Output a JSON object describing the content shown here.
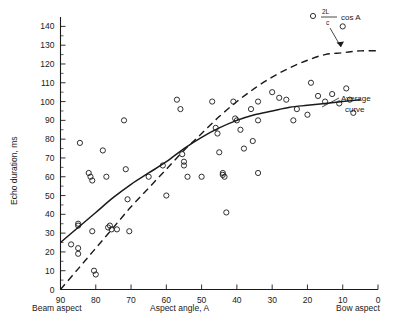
{
  "chart_data": {
    "type": "scatter",
    "title": "",
    "xlabel": "Aspect angle, A",
    "ylabel": "Echo duration, ms",
    "xlim": [
      90,
      0
    ],
    "ylim": [
      0,
      145
    ],
    "x_reversed": true,
    "grid": false,
    "legend_position": "none",
    "xticks": [
      90,
      80,
      70,
      60,
      50,
      40,
      30,
      20,
      10,
      0
    ],
    "xticklabels": [
      "90",
      "80",
      "70",
      "60",
      "50",
      "40",
      "30",
      "20",
      "10",
      "0"
    ],
    "yticks": [
      0,
      10,
      20,
      30,
      40,
      50,
      60,
      70,
      80,
      90,
      100,
      110,
      120,
      130,
      140
    ],
    "yticklabels": [
      "0",
      "10",
      "20",
      "30",
      "40",
      "50",
      "60",
      "70",
      "80",
      "90",
      "100",
      "110",
      "120",
      "130",
      "140"
    ],
    "x_end_labels": {
      "left": "Beam aspect",
      "right": "Bow aspect"
    },
    "points": [
      [
        87,
        24
      ],
      [
        85,
        35
      ],
      [
        85,
        34
      ],
      [
        85,
        22
      ],
      [
        85,
        19
      ],
      [
        84.5,
        78
      ],
      [
        82,
        62
      ],
      [
        81.5,
        60
      ],
      [
        81,
        58
      ],
      [
        81,
        31
      ],
      [
        80.5,
        10
      ],
      [
        80,
        8
      ],
      [
        78,
        74
      ],
      [
        77,
        60
      ],
      [
        76.5,
        33
      ],
      [
        76,
        34
      ],
      [
        75.5,
        32
      ],
      [
        74,
        32
      ],
      [
        72,
        90
      ],
      [
        71.5,
        64
      ],
      [
        71,
        48
      ],
      [
        70.5,
        31
      ],
      [
        65,
        60
      ],
      [
        61,
        66
      ],
      [
        60,
        50
      ],
      [
        57,
        101
      ],
      [
        56,
        96
      ],
      [
        55.5,
        72
      ],
      [
        55,
        68
      ],
      [
        55,
        66
      ],
      [
        54,
        60
      ],
      [
        50,
        60
      ],
      [
        47,
        100
      ],
      [
        46,
        86
      ],
      [
        45.5,
        83
      ],
      [
        45,
        73
      ],
      [
        44,
        62
      ],
      [
        44,
        61
      ],
      [
        43.5,
        60
      ],
      [
        43,
        41
      ],
      [
        41,
        100
      ],
      [
        40.5,
        91
      ],
      [
        40,
        90
      ],
      [
        39,
        85
      ],
      [
        38,
        75
      ],
      [
        36,
        96
      ],
      [
        35.5,
        79
      ],
      [
        34,
        100
      ],
      [
        34,
        90
      ],
      [
        34,
        62
      ],
      [
        30,
        105
      ],
      [
        28,
        102
      ],
      [
        26,
        101
      ],
      [
        24,
        90
      ],
      [
        23,
        96
      ],
      [
        20,
        93
      ],
      [
        19,
        110
      ],
      [
        17,
        103
      ],
      [
        15,
        100
      ],
      [
        13,
        104
      ],
      [
        11,
        99
      ],
      [
        10,
        140
      ],
      [
        9,
        107
      ],
      [
        8,
        101
      ],
      [
        7,
        94
      ]
    ],
    "series": [
      {
        "name": "Average curve",
        "style": "solid",
        "annotation": "Average curve",
        "points": [
          [
            90,
            25
          ],
          [
            85,
            33
          ],
          [
            80,
            41
          ],
          [
            75,
            49
          ],
          [
            70,
            56
          ],
          [
            65,
            62
          ],
          [
            60,
            68
          ],
          [
            55,
            75
          ],
          [
            50,
            81
          ],
          [
            45,
            86
          ],
          [
            40,
            90
          ],
          [
            35,
            93
          ],
          [
            30,
            95
          ],
          [
            25,
            97
          ],
          [
            20,
            98
          ],
          [
            15,
            99
          ],
          [
            10,
            100
          ],
          [
            5,
            101
          ]
        ]
      },
      {
        "name": "2L/c cos A",
        "style": "dashed",
        "annotation_numerator": "2L",
        "annotation_denominator": "c",
        "annotation_suffix": "cos A",
        "points": [
          [
            90,
            0
          ],
          [
            85,
            11
          ],
          [
            80,
            22
          ],
          [
            75,
            33
          ],
          [
            70,
            44
          ],
          [
            65,
            54
          ],
          [
            60,
            64
          ],
          [
            55,
            74
          ],
          [
            50,
            83
          ],
          [
            45,
            92
          ],
          [
            40,
            100
          ],
          [
            35,
            107
          ],
          [
            30,
            113
          ],
          [
            25,
            118
          ],
          [
            20,
            122
          ],
          [
            15,
            125
          ],
          [
            10,
            126
          ],
          [
            5,
            127
          ],
          [
            0,
            127
          ]
        ]
      }
    ]
  }
}
